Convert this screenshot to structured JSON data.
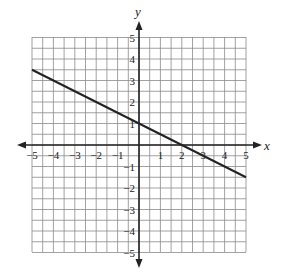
{
  "chart_data": {
    "type": "line",
    "title": "",
    "xlabel": "x",
    "ylabel": "y",
    "xlim": [
      -5,
      5
    ],
    "ylim": [
      -5,
      5
    ],
    "grid": true,
    "grid_step": 0.5,
    "x_ticks": [
      -5,
      -4,
      -3,
      -2,
      -1,
      1,
      2,
      3,
      4,
      5
    ],
    "y_ticks": [
      -5,
      -4,
      -3,
      -2,
      -1,
      1,
      2,
      3,
      4,
      5
    ],
    "x_tick_labels": [
      "−5",
      "−4",
      "−3",
      "−2",
      "−1",
      "1",
      "2",
      "3",
      "4",
      "5"
    ],
    "y_tick_labels": [
      "−5",
      "−4",
      "−3",
      "−2",
      "−1",
      "1",
      "2",
      "3",
      "4",
      "5"
    ],
    "series": [
      {
        "name": "line",
        "x": [
          -5,
          5
        ],
        "y": [
          3.5,
          -1.5
        ],
        "slope": -0.5,
        "y_intercept": 1,
        "x_intercept": 2
      }
    ],
    "legend": null
  },
  "colors": {
    "grid": "#8a8a8a",
    "axis": "#222222",
    "line": "#222222"
  }
}
